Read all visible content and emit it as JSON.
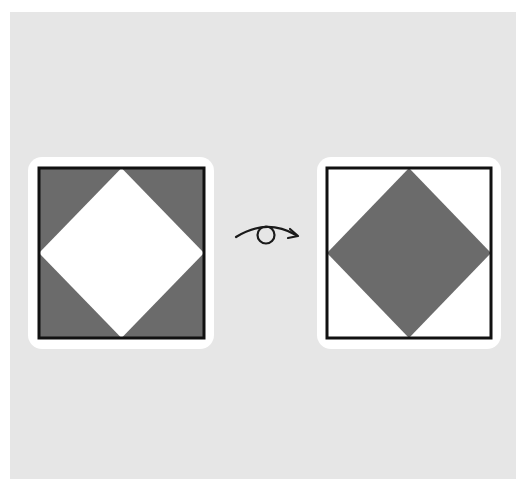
{
  "diagram": {
    "colors": {
      "background_outer": "#ffffff",
      "panel": "#e6e6e6",
      "card": "#ffffff",
      "border": "#111111",
      "dark_fill": "#6b6b6b",
      "light_fill": "#ffffff",
      "icon_stroke": "#1a1a1a"
    },
    "left_tile": {
      "label": "Original tile: gray corners, white diamond",
      "corner_fill": "#6b6b6b",
      "diamond_fill": "#ffffff"
    },
    "transform_icon": {
      "label": "Flip / rotate over",
      "icon": "flip-rotation-arrow-icon"
    },
    "right_tile": {
      "label": "Flipped tile: white corners, gray diamond",
      "corner_fill": "#ffffff",
      "diamond_fill": "#6b6b6b"
    }
  }
}
